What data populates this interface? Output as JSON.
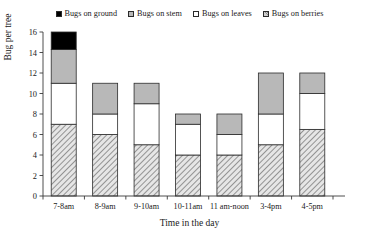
{
  "chart_data": {
    "type": "bar",
    "subtype": "stacked-bar",
    "title": "",
    "xlabel": "Time in the day",
    "ylabel": "Bug per tree",
    "ylim": [
      0,
      16
    ],
    "ytick_step": 2,
    "yticks": [
      "0",
      "2",
      "4",
      "6",
      "8",
      "10",
      "12",
      "14",
      "16"
    ],
    "grid": false,
    "legend_position": "top-center",
    "categories": [
      "7-8am",
      "8-9am",
      "9-10am",
      "10-11am",
      "11 am-noon",
      "3-4pm",
      "4-5pm"
    ],
    "series": [
      {
        "name": "Bugs on berries",
        "values": [
          7,
          6,
          5,
          4,
          4,
          5,
          6.5
        ],
        "color": "#cfcfcf",
        "pattern": "diagonal-hatch"
      },
      {
        "name": "Bugs on leaves",
        "values": [
          4,
          2,
          4,
          3,
          2,
          3,
          3.5
        ],
        "color": "#ffffff",
        "pattern": "solid"
      },
      {
        "name": "Bugs on stem",
        "values": [
          3.3,
          3,
          2,
          1,
          2,
          4,
          2
        ],
        "color": "#b8b8b8",
        "pattern": "solid"
      },
      {
        "name": "Bugs on ground",
        "values": [
          1.7,
          0,
          0,
          0,
          0,
          0,
          0
        ],
        "color": "#000000",
        "pattern": "solid"
      }
    ],
    "totals": [
      16,
      11,
      11,
      8,
      8,
      12,
      12
    ]
  },
  "legend": {
    "items": [
      {
        "label": "Bugs on ground",
        "swatch": "ground"
      },
      {
        "label": "Bugs on stem",
        "swatch": "stem"
      },
      {
        "label": "Bugs on leaves",
        "swatch": "leaves"
      },
      {
        "label": "Bugs on berries",
        "swatch": "berries"
      }
    ]
  },
  "axes": {
    "y_title": "Bug per tree",
    "x_title": "Time in the day"
  }
}
